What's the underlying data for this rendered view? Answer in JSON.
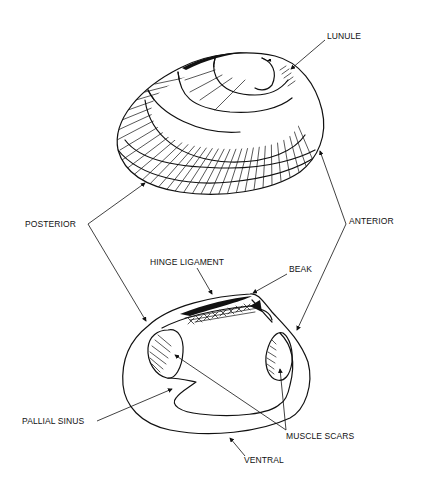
{
  "diagram": {
    "labels": {
      "lunule": "LUNULE",
      "posterior": "POSTERIOR",
      "anterior": "ANTERIOR",
      "hinge_ligament": "HINGE LIGAMENT",
      "beak": "BEAK",
      "pallial_sinus": "PALLIAL SINUS",
      "muscle_scars": "MUSCLE SCARS",
      "ventral": "VENTRAL"
    },
    "colors": {
      "ink": "#111111",
      "background": "#ffffff"
    }
  }
}
